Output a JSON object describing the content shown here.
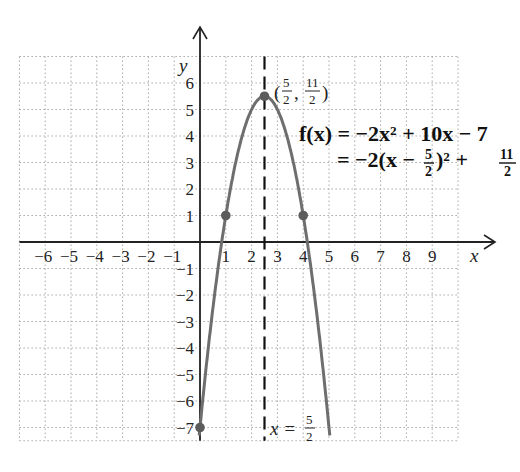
{
  "chart_data": {
    "type": "line",
    "title": "",
    "xlabel": "x",
    "ylabel": "y",
    "xlim": [
      -7,
      10
    ],
    "ylim": [
      -7.5,
      7
    ],
    "grid": true,
    "x_ticks": [
      "-6",
      "-5",
      "-4",
      "-3",
      "-2",
      "-1",
      "1",
      "2",
      "3",
      "4",
      "5",
      "6",
      "7",
      "8",
      "9"
    ],
    "y_ticks": [
      "6",
      "5",
      "4",
      "3",
      "2",
      "1",
      "-1",
      "-2",
      "-3",
      "-4",
      "-5",
      "-6",
      "-7"
    ],
    "series": [
      {
        "name": "f(x) = -2x^2 + 10x - 7",
        "function": "-2*x^2 + 10*x - 7",
        "color": "#6e6e6e",
        "x_range": [
          -0.05,
          5.05
        ]
      }
    ],
    "points": [
      {
        "x": 0,
        "y": -7
      },
      {
        "x": 1,
        "y": 1
      },
      {
        "x": 2.5,
        "y": 5.5
      },
      {
        "x": 4,
        "y": 1
      }
    ],
    "axis_of_symmetry": {
      "x": 2.5,
      "style": "dashed"
    },
    "annotations": {
      "vertex": {
        "open": "(",
        "n1": "5",
        "d1": "2",
        "comma": ",",
        "n2": "11",
        "d2": "2",
        "close": ")"
      },
      "equation_line1": "f(x) = −2x² + 10x − 7",
      "equation_line2_prefix": "= −2(x −",
      "equation_line2_frac_n": "5",
      "equation_line2_frac_d": "2",
      "equation_line2_mid": ")² +",
      "equation_line2_frac2_n": "11",
      "equation_line2_frac2_d": "2",
      "symmetry_label_prefix": "x =",
      "symmetry_label_n": "5",
      "symmetry_label_d": "2"
    }
  },
  "colors": {
    "curve": "#6e6e6e",
    "point": "#5c5c5c",
    "axis": "#222222",
    "grid": "#a8a8a8"
  }
}
